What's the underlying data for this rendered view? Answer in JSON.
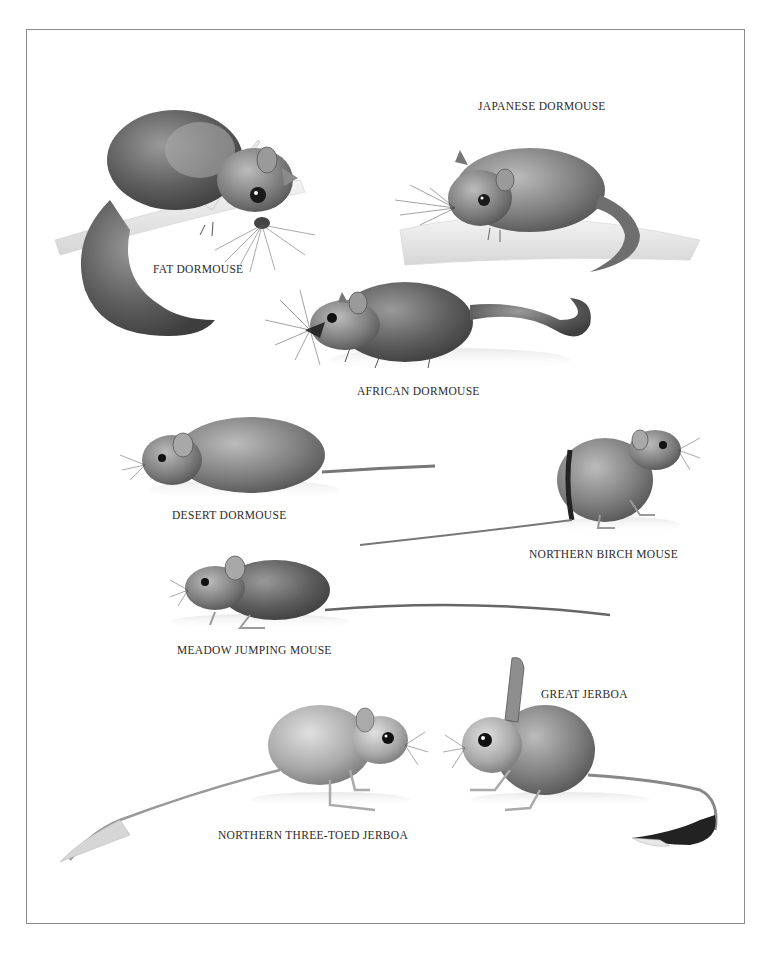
{
  "plate": {
    "palette": {
      "ink": "#2a2a2a",
      "dark_fur": "#4a4a4a",
      "mid_fur": "#7a7a7a",
      "light_fur": "#b5b5b5",
      "pale": "#e2e2e2",
      "branch": "#ececec",
      "frame": "#8a8a8a"
    },
    "species": [
      {
        "id": "fat-dormouse",
        "label": "FAT DORMOUSE",
        "label_pos": [
          153,
          263
        ]
      },
      {
        "id": "japanese-dormouse",
        "label": "JAPANESE DORMOUSE",
        "label_pos": [
          478,
          100
        ]
      },
      {
        "id": "african-dormouse",
        "label": "AFRICAN DORMOUSE",
        "label_pos": [
          357,
          385
        ]
      },
      {
        "id": "desert-dormouse",
        "label": "DESERT DORMOUSE",
        "label_pos": [
          172,
          509
        ]
      },
      {
        "id": "northern-birch-mouse",
        "label": "NORTHERN BIRCH MOUSE",
        "label_pos": [
          529,
          548
        ]
      },
      {
        "id": "meadow-jumping-mouse",
        "label": "MEADOW JUMPING MOUSE",
        "label_pos": [
          177,
          644
        ]
      },
      {
        "id": "great-jerboa",
        "label": "GREAT JERBOA",
        "label_pos": [
          541,
          688
        ]
      },
      {
        "id": "northern-three-toed-jerboa",
        "label": "NORTHERN THREE-TOED JERBOA",
        "label_pos": [
          218,
          829
        ]
      }
    ]
  }
}
